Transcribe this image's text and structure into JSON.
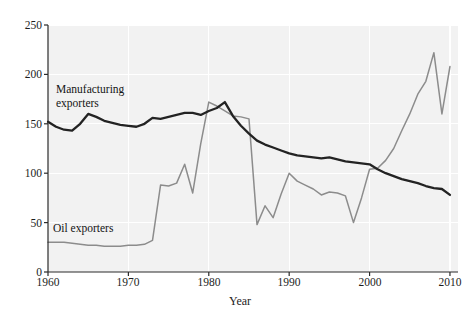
{
  "chart_data": {
    "type": "line",
    "title": "",
    "xlabel": "Year",
    "ylabel": "",
    "xlim": [
      1960,
      2011
    ],
    "ylim": [
      0,
      250
    ],
    "grid": true,
    "legend_position": "inline-annotations",
    "xticks": [
      "1960",
      "1970",
      "1980",
      "1990",
      "2000",
      "2010"
    ],
    "xtick_values": [
      1960,
      1970,
      1980,
      1990,
      2000,
      2010
    ],
    "yticks": [
      "0",
      "50",
      "100",
      "150",
      "200",
      "250"
    ],
    "ytick_values": [
      0,
      50,
      100,
      150,
      200,
      250
    ],
    "x": [
      1960,
      1961,
      1962,
      1963,
      1964,
      1965,
      1966,
      1967,
      1968,
      1969,
      1970,
      1971,
      1972,
      1973,
      1974,
      1975,
      1976,
      1977,
      1978,
      1979,
      1980,
      1981,
      1982,
      1983,
      1984,
      1985,
      1986,
      1987,
      1988,
      1989,
      1990,
      1991,
      1992,
      1993,
      1994,
      1995,
      1996,
      1997,
      1998,
      1999,
      2000,
      2001,
      2002,
      2003,
      2004,
      2005,
      2006,
      2007,
      2008,
      2009,
      2010
    ],
    "series": [
      {
        "name": "Manufacturing exporters",
        "color": "#232323",
        "values": [
          152,
          147,
          144,
          143,
          150,
          160,
          157,
          153,
          151,
          149,
          148,
          147,
          150,
          156,
          155,
          157,
          159,
          161,
          161,
          159,
          163,
          166,
          172,
          158,
          148,
          140,
          133,
          129,
          126,
          123,
          120,
          118,
          117,
          116,
          115,
          116,
          114,
          112,
          111,
          110,
          109,
          104,
          100,
          97,
          94,
          92,
          90,
          87,
          85,
          84,
          78
        ],
        "annotation": {
          "text": "Manufacturing exporters",
          "x": 1962,
          "y": 180
        }
      },
      {
        "name": "Oil exporters",
        "color": "#8c8c8c",
        "values": [
          30,
          30,
          30,
          29,
          28,
          27,
          27,
          26,
          26,
          26,
          27,
          27,
          28,
          32,
          88,
          87,
          90,
          109,
          80,
          130,
          172,
          168,
          163,
          158,
          157,
          155,
          48,
          67,
          55,
          79,
          100,
          92,
          88,
          84,
          78,
          81,
          80,
          77,
          50,
          75,
          104,
          105,
          113,
          125,
          143,
          160,
          180,
          193,
          222,
          160,
          208
        ],
        "annotation": {
          "text": "Oil exporters",
          "x": 1962,
          "y": 45
        }
      }
    ]
  },
  "labels": {
    "manufacturing_line1": "Manufacturing",
    "manufacturing_line2": "exporters",
    "oil": "Oil exporters",
    "xaxis_title": "Year",
    "y_250": "250",
    "y_200": "200",
    "y_150": "150",
    "y_100": "100",
    "y_50": "50",
    "y_0": "0",
    "x_1960": "1960",
    "x_1970": "1970",
    "x_1980": "1980",
    "x_1990": "1990",
    "x_2000": "2000",
    "x_2010": "2010"
  },
  "colors": {
    "manufacturing": "#232323",
    "oil": "#8c8c8c",
    "plot_background": "#f2f2f2",
    "gridline": "#ffffff",
    "axis": "#2b2b2b"
  }
}
